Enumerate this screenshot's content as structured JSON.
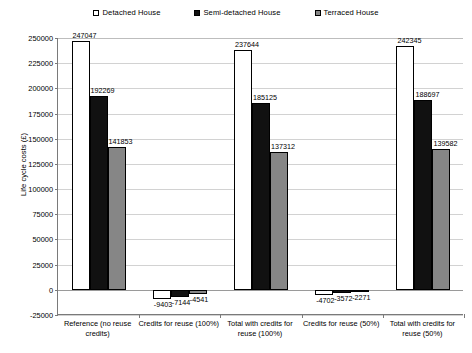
{
  "chart_data": {
    "type": "bar",
    "title": "",
    "xlabel": "",
    "ylabel": "Life cycle costs (£)",
    "ylim": [
      -25000,
      250000
    ],
    "ytick_step": 25000,
    "yticks": [
      "250000",
      "225000",
      "200000",
      "175000",
      "150000",
      "125000",
      "100000",
      "75000",
      "50000",
      "25000",
      "0",
      "-25000"
    ],
    "grid": true,
    "legend_position": "top-center",
    "categories": [
      "Reference (no reuse credits)",
      "Credits for reuse (100%)",
      "Total with credits for reuse (100%)",
      "Credits for reuse (50%)",
      "Total with credits for reuse (50%)"
    ],
    "series": [
      {
        "name": "Detached House",
        "color": "#ffffff",
        "values": [
          247047,
          -9403,
          237644,
          -4702,
          242345
        ],
        "labels": [
          "247047",
          "-9403",
          "237644",
          "-4702",
          "242345"
        ]
      },
      {
        "name": "Semi-detached House",
        "color": "#111111",
        "values": [
          192269,
          -7144,
          185125,
          -3572,
          188697
        ],
        "labels": [
          "192269",
          "-7144",
          "185125",
          "-3572",
          "188697"
        ]
      },
      {
        "name": "Terraced House",
        "color": "#868686",
        "values": [
          141853,
          -4541,
          137312,
          -2271,
          139582
        ],
        "labels": [
          "141853",
          "-4541",
          "137312",
          "-2271",
          "139582"
        ]
      }
    ]
  },
  "legend": {
    "items": [
      {
        "label": "Detached House",
        "color": "#ffffff"
      },
      {
        "label": "Semi-detached House",
        "color": "#111111"
      },
      {
        "label": "Terraced House",
        "color": "#868686"
      }
    ]
  },
  "axis": {
    "y_title": "Life cycle costs (£)"
  }
}
